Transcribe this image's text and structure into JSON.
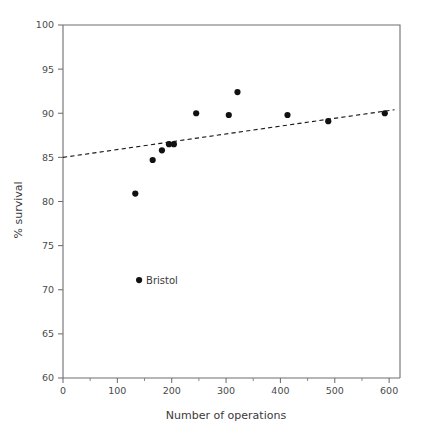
{
  "chart_data": {
    "type": "scatter",
    "title": "",
    "xlabel": "Number of operations",
    "ylabel": "% survival",
    "xlim": [
      0,
      620
    ],
    "ylim": [
      60,
      100
    ],
    "xticks": [
      0,
      100,
      200,
      300,
      400,
      500,
      600
    ],
    "xtick_labels": [
      "0",
      "100",
      "200",
      "300",
      "400",
      "500",
      "600"
    ],
    "xminor_ticks": [
      50,
      150,
      250,
      350,
      450,
      550
    ],
    "yticks": [
      60,
      65,
      70,
      75,
      80,
      85,
      90,
      95,
      100
    ],
    "ytick_labels": [
      "60",
      "65",
      "70",
      "75",
      "80",
      "85",
      "90",
      "95",
      "100"
    ],
    "grid": false,
    "legend": false,
    "points": [
      {
        "x": 133,
        "y": 80.9,
        "label": ""
      },
      {
        "x": 140,
        "y": 71.1,
        "label": "Bristol"
      },
      {
        "x": 165,
        "y": 84.7,
        "label": ""
      },
      {
        "x": 182,
        "y": 85.8,
        "label": ""
      },
      {
        "x": 195,
        "y": 86.5,
        "label": ""
      },
      {
        "x": 204,
        "y": 86.5,
        "label": ""
      },
      {
        "x": 245,
        "y": 90.0,
        "label": ""
      },
      {
        "x": 305,
        "y": 89.8,
        "label": ""
      },
      {
        "x": 321,
        "y": 92.4,
        "label": ""
      },
      {
        "x": 413,
        "y": 89.8,
        "label": ""
      },
      {
        "x": 488,
        "y": 89.1,
        "label": ""
      },
      {
        "x": 592,
        "y": 90.0,
        "label": ""
      }
    ],
    "trendline": {
      "x0": 0,
      "y0": 85.0,
      "x1": 610,
      "y1": 90.4,
      "style": "dashed"
    },
    "annotations": [
      {
        "text": "Bristol",
        "x": 140,
        "y": 71.1,
        "position": "right"
      }
    ]
  }
}
